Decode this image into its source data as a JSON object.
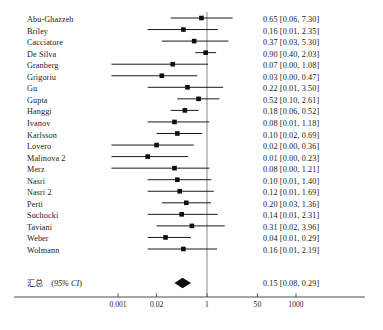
{
  "chart_data": {
    "type": "forest",
    "title": "",
    "xlabel": "",
    "ylabel": "",
    "x_scale": "log",
    "x_ticks": [
      "0.001",
      "0.02",
      "1",
      "50",
      "1000"
    ],
    "x_tick_values": [
      0.001,
      0.02,
      1,
      50,
      1000
    ],
    "xlim": [
      0.001,
      1000
    ],
    "null_line": 1,
    "grid": false,
    "legend": "none",
    "effect_measure": "Odds Ratio",
    "ci_level": "95% CI",
    "columns": [
      "Study",
      "Estimate [95% CI]"
    ],
    "studies": [
      {
        "name": "Abu-Ghazzeh",
        "estimate": 0.65,
        "lower": 0.06,
        "upper": 7.3,
        "label": "0.65 [0.06, 7.30]"
      },
      {
        "name": "Briley",
        "estimate": 0.16,
        "lower": 0.01,
        "upper": 2.35,
        "label": "0.16 [0.01, 2.35]"
      },
      {
        "name": "Cacciatore",
        "estimate": 0.37,
        "lower": 0.03,
        "upper": 5.3,
        "label": "0.37 [0.03, 5.30]"
      },
      {
        "name": "De Silva",
        "estimate": 0.9,
        "lower": 0.4,
        "upper": 2.03,
        "label": "0.90 [0.40, 2.03]"
      },
      {
        "name": "Granberg",
        "estimate": 0.07,
        "lower": 0.0,
        "upper": 1.08,
        "label": "0.07 [0.00, 1.08]"
      },
      {
        "name": "Grigoriu",
        "estimate": 0.03,
        "lower": 0.0,
        "upper": 0.47,
        "label": "0.03 [0.00, 0.47]"
      },
      {
        "name": "Gu",
        "estimate": 0.22,
        "lower": 0.01,
        "upper": 3.5,
        "label": "0.22 [0.01, 3.50]"
      },
      {
        "name": "Gupta",
        "estimate": 0.52,
        "lower": 0.1,
        "upper": 2.61,
        "label": "0.52 [0.10, 2.61]"
      },
      {
        "name": "Hanggi",
        "estimate": 0.18,
        "lower": 0.06,
        "upper": 0.52,
        "label": "0.18 [0.06, 0.52]"
      },
      {
        "name": "Ivanov",
        "estimate": 0.08,
        "lower": 0.01,
        "upper": 1.18,
        "label": "0.08 [0.01, 1.18]"
      },
      {
        "name": "Karlsson",
        "estimate": 0.1,
        "lower": 0.02,
        "upper": 0.69,
        "label": "0.10 [0.02, 0.69]"
      },
      {
        "name": "Lovero",
        "estimate": 0.02,
        "lower": 0.0,
        "upper": 0.36,
        "label": "0.02 [0.00, 0.36]"
      },
      {
        "name": "Malinova 2",
        "estimate": 0.01,
        "lower": 0.0,
        "upper": 0.23,
        "label": "0.01 [0.00, 0.23]"
      },
      {
        "name": "Merz",
        "estimate": 0.08,
        "lower": 0.0,
        "upper": 1.21,
        "label": "0.08 [0.00, 1.21]"
      },
      {
        "name": "Nasri",
        "estimate": 0.1,
        "lower": 0.01,
        "upper": 1.4,
        "label": "0.10 [0.01, 1.40]"
      },
      {
        "name": "Nasri 2",
        "estimate": 0.12,
        "lower": 0.01,
        "upper": 1.69,
        "label": "0.12 [0.01, 1.69]"
      },
      {
        "name": "Perti",
        "estimate": 0.2,
        "lower": 0.03,
        "upper": 1.36,
        "label": "0.20 [0.03, 1.36]"
      },
      {
        "name": "Suchocki",
        "estimate": 0.14,
        "lower": 0.01,
        "upper": 2.31,
        "label": "0.14 [0.01, 2.31]"
      },
      {
        "name": "Taviani",
        "estimate": 0.31,
        "lower": 0.02,
        "upper": 3.96,
        "label": "0.31 [0.02, 3.96]"
      },
      {
        "name": "Weber",
        "estimate": 0.04,
        "lower": 0.01,
        "upper": 0.29,
        "label": "0.04 [0.01, 0.29]"
      },
      {
        "name": "Wolmann",
        "estimate": 0.16,
        "lower": 0.01,
        "upper": 2.19,
        "label": "0.16 [0.01, 2.19]"
      }
    ],
    "summary": {
      "name_cn": "汇总",
      "name_ci": "(95% CI)",
      "estimate": 0.15,
      "lower": 0.08,
      "upper": 0.29,
      "label": "0.15 [0.08, 0.29]"
    }
  },
  "colors": {
    "marker": "#0d0d0d",
    "line": "#1a1a1a",
    "null_line": "#8a8a8a",
    "axis": "#4d4d4d",
    "text": "#1a1a1a",
    "background": "#ffffff"
  }
}
